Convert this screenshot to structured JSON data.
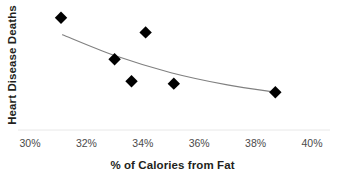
{
  "chart_data": {
    "type": "scatter",
    "title": "",
    "xlabel": "% of Calories from Fat",
    "ylabel": "Heart Disease Deaths",
    "xlim": [
      30,
      40
    ],
    "ylim": [
      0,
      100
    ],
    "grid": false,
    "legend": null,
    "x_tick_labels": [
      "30%",
      "32%",
      "34%",
      "36%",
      "38%",
      "40%"
    ],
    "x_ticks": [
      30,
      32,
      34,
      36,
      38,
      40
    ],
    "y_tick_labels": [],
    "axis_line_color": "#e8e8e8",
    "marker_color": "#000000",
    "marker_shape": "diamond",
    "trendline_color": "#808080",
    "series": [
      {
        "name": "Heart Disease Deaths",
        "marker": "diamond",
        "color": "#000000",
        "points": [
          {
            "x": 31.1,
            "y": 92
          },
          {
            "x": 33.0,
            "y": 58
          },
          {
            "x": 33.6,
            "y": 40
          },
          {
            "x": 34.1,
            "y": 80
          },
          {
            "x": 35.1,
            "y": 38
          },
          {
            "x": 38.7,
            "y": 31
          }
        ]
      },
      {
        "name": "Trend line",
        "type": "line",
        "color": "#808080",
        "points": [
          {
            "x": 31.15,
            "y": 78
          },
          {
            "x": 33.0,
            "y": 61
          },
          {
            "x": 35.0,
            "y": 47
          },
          {
            "x": 37.0,
            "y": 37
          },
          {
            "x": 38.7,
            "y": 31
          }
        ]
      }
    ]
  }
}
